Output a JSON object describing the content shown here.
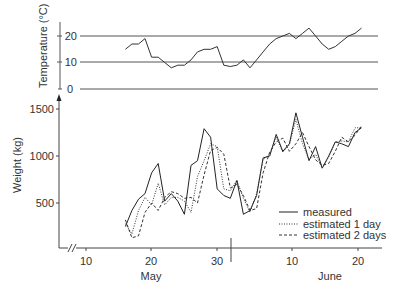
{
  "chart_data": [
    {
      "type": "line",
      "title": "",
      "ylabel": "Temperature (°C)",
      "xlabel": "",
      "ylim": [
        0,
        25
      ],
      "yticks": [
        0,
        10,
        20
      ],
      "grid": "horizontal lines at 0, 10, 20",
      "x_day_index": [
        16,
        17,
        18,
        19,
        20,
        21,
        22,
        23,
        24,
        25,
        26,
        27,
        28,
        29,
        30,
        31,
        32,
        33,
        34,
        35,
        36,
        37,
        38,
        39,
        40,
        41,
        42,
        43,
        44,
        45,
        46,
        47,
        48,
        49,
        50,
        51,
        52
      ],
      "series": [
        {
          "name": "temperature",
          "values": [
            15,
            17,
            17,
            19,
            12,
            12,
            10,
            8,
            9,
            9,
            11,
            14,
            15,
            15,
            16,
            9,
            8.5,
            9,
            11,
            8,
            11,
            14,
            17,
            19,
            20,
            21,
            19,
            21,
            23,
            20,
            17,
            15,
            16,
            18,
            20,
            21,
            23
          ]
        }
      ]
    },
    {
      "type": "line",
      "title": "",
      "ylabel": "Weight (kg)",
      "xlabel": "",
      "ylim": [
        0,
        1600
      ],
      "yticks": [
        500,
        1000,
        1500
      ],
      "x_ticks": [
        {
          "day": 10,
          "label": "10",
          "month": "May"
        },
        {
          "day": 20,
          "label": "20",
          "month": "May"
        },
        {
          "day": 30,
          "label": "30",
          "month": "May"
        },
        {
          "day": 41,
          "label": "10",
          "month": "June"
        },
        {
          "day": 51,
          "label": "20",
          "month": "June"
        }
      ],
      "month_labels": [
        "May",
        "June"
      ],
      "axis_break": true,
      "legend_position": "lower right",
      "x_day_index": [
        16,
        17,
        18,
        19,
        20,
        21,
        22,
        23,
        24,
        25,
        26,
        27,
        28,
        29,
        30,
        31,
        32,
        33,
        34,
        35,
        36,
        37,
        38,
        39,
        40,
        41,
        42,
        43,
        44,
        45,
        46,
        47,
        48,
        49,
        50,
        51,
        52
      ],
      "series": [
        {
          "name": "measured",
          "style": "solid",
          "values": [
            250,
            420,
            540,
            600,
            820,
            920,
            520,
            600,
            520,
            380,
            900,
            950,
            1290,
            1200,
            650,
            580,
            550,
            740,
            380,
            420,
            580,
            980,
            1000,
            1230,
            1050,
            1130,
            1460,
            1200,
            950,
            1100,
            870,
            1000,
            1150,
            1130,
            1100,
            1250,
            1300
          ]
        },
        {
          "name": "estimated 1 day",
          "style": "dotted",
          "values": [
            280,
            170,
            420,
            560,
            480,
            710,
            480,
            560,
            560,
            520,
            400,
            780,
            950,
            1130,
            1100,
            650,
            630,
            740,
            550,
            400,
            600,
            960,
            1020,
            1200,
            1040,
            1120,
            1390,
            1130,
            960,
            1020,
            870,
            990,
            1150,
            1160,
            1150,
            1300,
            1300
          ]
        },
        {
          "name": "estimated 2 days",
          "style": "dashed",
          "values": [
            320,
            130,
            150,
            400,
            500,
            420,
            560,
            620,
            600,
            550,
            560,
            500,
            800,
            1060,
            1090,
            1020,
            660,
            700,
            580,
            420,
            440,
            820,
            1040,
            1150,
            1190,
            1050,
            1130,
            1250,
            1100,
            960,
            900,
            920,
            1050,
            1200,
            1150,
            1220,
            1320
          ]
        }
      ]
    }
  ],
  "temperature_panel": {
    "ylabel": "Temperature (°C)",
    "ticks": [
      "20",
      "10",
      "0"
    ]
  },
  "weight_panel": {
    "ylabel": "Weight (kg)",
    "ticks": [
      "1500",
      "1000",
      "500"
    ],
    "xticks": [
      "10",
      "20",
      "30",
      "10",
      "20"
    ],
    "months": [
      "May",
      "June"
    ],
    "legend": [
      "measured",
      "estimated 1 day",
      "estimated 2 days"
    ]
  }
}
